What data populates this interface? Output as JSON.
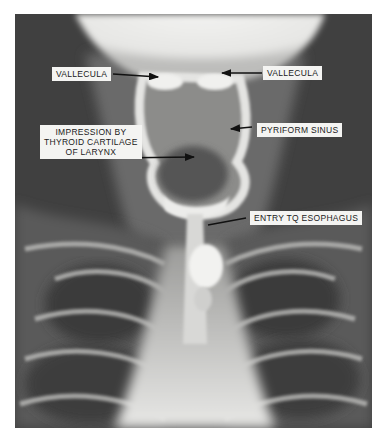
{
  "figure": {
    "type": "radiograph",
    "view": "frontal barium swallow of pharynx and upper esophagus",
    "colors": {
      "background": "#ffffff",
      "film_dark": "#3a3a3a",
      "label_bg": "#f4f4f2",
      "label_text": "#1a1a1a",
      "arrow": "#111111"
    }
  },
  "labels": [
    {
      "id": "vallecula-left",
      "text": "VALLECULA"
    },
    {
      "id": "vallecula-right",
      "text": "VALLECULA"
    },
    {
      "id": "impression",
      "text": "IMPRESSION BY\nTHYROID CARTILAGE\nOF LARYNX"
    },
    {
      "id": "pyriform-sinus",
      "text": "PYRIFORM SINUS"
    },
    {
      "id": "entry-esophagus",
      "text": "ENTRY TQ ESOPHAGUS"
    }
  ]
}
